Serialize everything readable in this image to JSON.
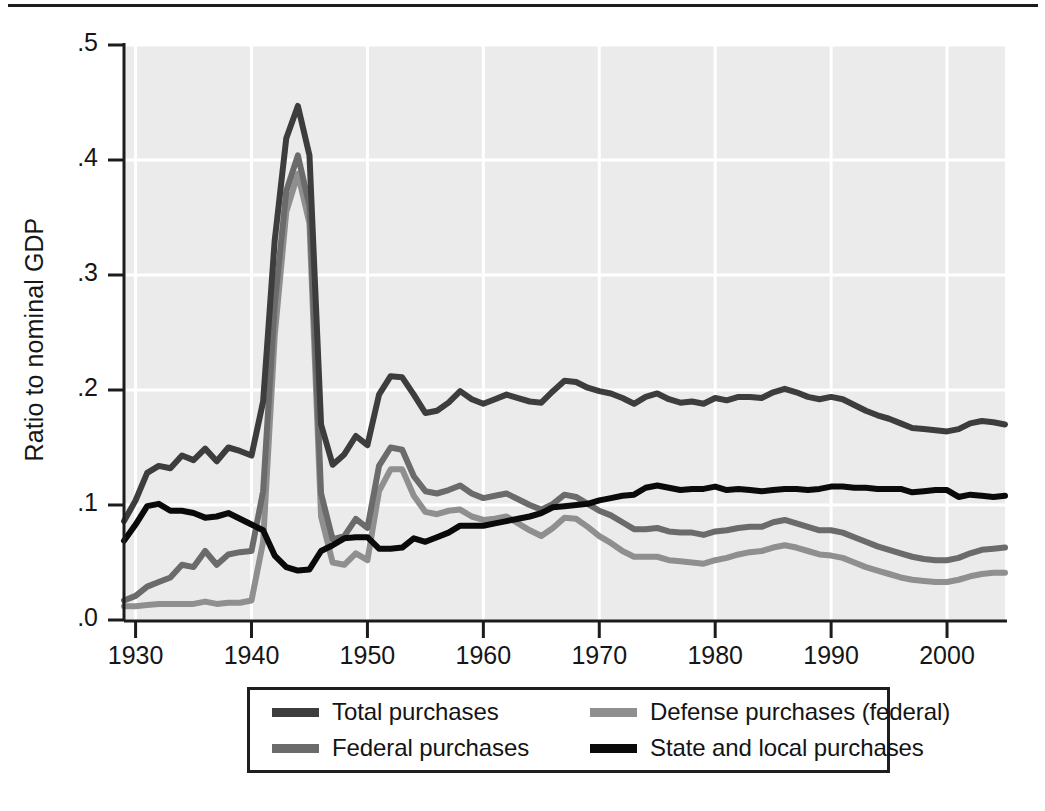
{
  "figure": {
    "background_color": "#ffffff",
    "plot_background_color": "#ebebeb",
    "gridline_color": "#ffffff",
    "axis_color": "#1c1c1c"
  },
  "axes": {
    "y_title": "Ratio to nominal GDP",
    "y_ticks": [
      ".0",
      ".1",
      ".2",
      ".3",
      ".4",
      ".5"
    ],
    "y_tick_values": [
      0.0,
      0.1,
      0.2,
      0.3,
      0.4,
      0.5
    ],
    "x_ticks": [
      "1930",
      "1940",
      "1950",
      "1960",
      "1970",
      "1980",
      "1990",
      "2000"
    ],
    "x_tick_values": [
      1930,
      1940,
      1950,
      1960,
      1970,
      1980,
      1990,
      2000
    ]
  },
  "legend": {
    "items": [
      {
        "label": "Total purchases",
        "color": "#3d3d3d"
      },
      {
        "label": "Defense purchases (federal)",
        "color": "#8f8f8f"
      },
      {
        "label": "Federal purchases",
        "color": "#6b6b6b"
      },
      {
        "label": "State and local purchases",
        "color": "#0a0a0a"
      }
    ]
  },
  "chart_data": {
    "type": "line",
    "title": "",
    "subtitle": "",
    "xlabel": "",
    "ylabel": "Ratio to nominal GDP",
    "xlim": [
      1929,
      2005
    ],
    "ylim": [
      0.0,
      0.5
    ],
    "grid": true,
    "legend_position": "bottom",
    "x": [
      1929,
      1930,
      1931,
      1932,
      1933,
      1934,
      1935,
      1936,
      1937,
      1938,
      1939,
      1940,
      1941,
      1942,
      1943,
      1944,
      1945,
      1946,
      1947,
      1948,
      1949,
      1950,
      1951,
      1952,
      1953,
      1954,
      1955,
      1956,
      1957,
      1958,
      1959,
      1960,
      1961,
      1962,
      1963,
      1964,
      1965,
      1966,
      1967,
      1968,
      1969,
      1970,
      1971,
      1972,
      1973,
      1974,
      1975,
      1976,
      1977,
      1978,
      1979,
      1980,
      1981,
      1982,
      1983,
      1984,
      1985,
      1986,
      1987,
      1988,
      1989,
      1990,
      1991,
      1992,
      1993,
      1994,
      1995,
      1996,
      1997,
      1998,
      1999,
      2000,
      2001,
      2002,
      2003,
      2004,
      2005
    ],
    "series": [
      {
        "name": "Total purchases",
        "color": "#3d3d3d",
        "values": [
          0.086,
          0.104,
          0.128,
          0.134,
          0.132,
          0.143,
          0.139,
          0.149,
          0.138,
          0.15,
          0.147,
          0.143,
          0.19,
          0.33,
          0.419,
          0.447,
          0.404,
          0.17,
          0.135,
          0.144,
          0.16,
          0.152,
          0.196,
          0.212,
          0.211,
          0.196,
          0.18,
          0.182,
          0.189,
          0.199,
          0.192,
          0.188,
          0.192,
          0.196,
          0.193,
          0.19,
          0.189,
          0.199,
          0.208,
          0.207,
          0.202,
          0.199,
          0.197,
          0.193,
          0.188,
          0.194,
          0.197,
          0.192,
          0.189,
          0.19,
          0.188,
          0.193,
          0.191,
          0.194,
          0.194,
          0.193,
          0.198,
          0.201,
          0.198,
          0.194,
          0.192,
          0.194,
          0.192,
          0.187,
          0.182,
          0.178,
          0.175,
          0.171,
          0.167,
          0.166,
          0.165,
          0.164,
          0.166,
          0.171,
          0.173,
          0.172,
          0.17
        ]
      },
      {
        "name": "Federal purchases",
        "color": "#6b6b6b",
        "values": [
          0.017,
          0.021,
          0.029,
          0.033,
          0.037,
          0.048,
          0.046,
          0.06,
          0.048,
          0.057,
          0.059,
          0.06,
          0.112,
          0.274,
          0.373,
          0.404,
          0.36,
          0.11,
          0.07,
          0.073,
          0.088,
          0.08,
          0.134,
          0.15,
          0.148,
          0.125,
          0.112,
          0.11,
          0.113,
          0.117,
          0.11,
          0.106,
          0.108,
          0.11,
          0.105,
          0.1,
          0.096,
          0.101,
          0.109,
          0.107,
          0.101,
          0.095,
          0.091,
          0.085,
          0.079,
          0.079,
          0.08,
          0.077,
          0.076,
          0.076,
          0.074,
          0.077,
          0.078,
          0.08,
          0.081,
          0.081,
          0.085,
          0.087,
          0.084,
          0.081,
          0.078,
          0.078,
          0.076,
          0.072,
          0.068,
          0.064,
          0.061,
          0.058,
          0.055,
          0.053,
          0.052,
          0.052,
          0.054,
          0.058,
          0.061,
          0.062,
          0.063
        ]
      },
      {
        "name": "Defense purchases (federal)",
        "color": "#8f8f8f",
        "values": [
          0.012,
          0.012,
          0.013,
          0.014,
          0.014,
          0.014,
          0.014,
          0.016,
          0.014,
          0.015,
          0.015,
          0.017,
          0.068,
          0.247,
          0.355,
          0.388,
          0.345,
          0.09,
          0.05,
          0.048,
          0.058,
          0.052,
          0.112,
          0.131,
          0.131,
          0.108,
          0.094,
          0.092,
          0.095,
          0.096,
          0.09,
          0.087,
          0.088,
          0.09,
          0.084,
          0.078,
          0.073,
          0.08,
          0.089,
          0.088,
          0.081,
          0.073,
          0.067,
          0.06,
          0.055,
          0.055,
          0.055,
          0.052,
          0.051,
          0.05,
          0.049,
          0.052,
          0.054,
          0.057,
          0.059,
          0.06,
          0.063,
          0.065,
          0.063,
          0.06,
          0.057,
          0.056,
          0.054,
          0.05,
          0.046,
          0.043,
          0.04,
          0.037,
          0.035,
          0.034,
          0.033,
          0.033,
          0.035,
          0.038,
          0.04,
          0.041,
          0.041
        ]
      },
      {
        "name": "State and local purchases",
        "color": "#0a0a0a",
        "values": [
          0.069,
          0.083,
          0.099,
          0.101,
          0.095,
          0.095,
          0.093,
          0.089,
          0.09,
          0.093,
          0.088,
          0.083,
          0.078,
          0.056,
          0.046,
          0.043,
          0.044,
          0.06,
          0.065,
          0.071,
          0.072,
          0.072,
          0.062,
          0.062,
          0.063,
          0.071,
          0.068,
          0.072,
          0.076,
          0.082,
          0.082,
          0.082,
          0.084,
          0.086,
          0.088,
          0.09,
          0.093,
          0.098,
          0.099,
          0.1,
          0.101,
          0.104,
          0.106,
          0.108,
          0.109,
          0.115,
          0.117,
          0.115,
          0.113,
          0.114,
          0.114,
          0.116,
          0.113,
          0.114,
          0.113,
          0.112,
          0.113,
          0.114,
          0.114,
          0.113,
          0.114,
          0.116,
          0.116,
          0.115,
          0.115,
          0.114,
          0.114,
          0.114,
          0.111,
          0.112,
          0.113,
          0.113,
          0.107,
          0.109,
          0.108,
          0.107,
          0.108
        ]
      }
    ]
  }
}
